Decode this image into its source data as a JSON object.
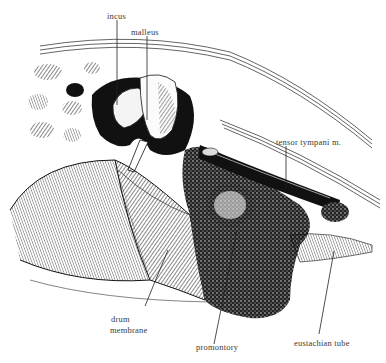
{
  "figure": {
    "style": "black-and-white pen-and-ink engraving",
    "colors": {
      "ink": "#111111",
      "background": "#ffffff",
      "label_text": "#3a3a3a"
    }
  },
  "labels": [
    {
      "id": "incus",
      "text": "incus"
    },
    {
      "id": "malleus",
      "text": "malleus"
    },
    {
      "id": "tensor_tympani",
      "text": "tensor tympani m."
    },
    {
      "id": "drum_membrane_line1",
      "text": "drum"
    },
    {
      "id": "drum_membrane_line2",
      "text": "membrane"
    },
    {
      "id": "promontory",
      "text": "promontory"
    },
    {
      "id": "eustachian_tube",
      "text": "eustachian tube"
    }
  ]
}
